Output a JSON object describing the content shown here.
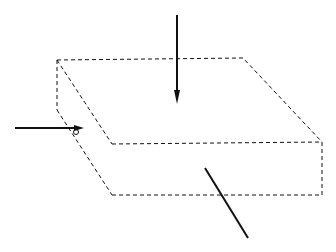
{
  "diagram": {
    "title": "",
    "labels": {
      "hz": {
        "main": "H",
        "sub": "z"
      },
      "hx": {
        "main": "H",
        "sub": "x"
      },
      "hy": {
        "main": "H",
        "sub": "y"
      }
    },
    "shape": "folded corrugated slab (meander winding) with dashed outline",
    "front_folds": 20,
    "side_folds": 8,
    "colors": {
      "line": "#111111",
      "background": "#ffffff"
    }
  }
}
